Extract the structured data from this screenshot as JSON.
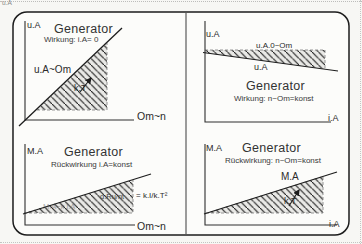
{
  "artifacts": {
    "corner_text": "u.A"
  },
  "colors": {
    "panel_border": "#1c1c1c",
    "axis": "#2e2e2e",
    "hatch_fill": "#e9e9e6",
    "hatch_line": "#1c1c1c",
    "dashed": "#8a8a8a"
  },
  "quadrants": {
    "top_left": {
      "y_axis": "u.A",
      "title": "Generator",
      "subtitle": "Wirkung: i.A= 0",
      "curve_label": "u.A~Om",
      "area_label": "k.T",
      "x_axis": "Om~n"
    },
    "top_right": {
      "y_axis": "u.A",
      "title": "Generator",
      "subtitle": "Wirkung: n~Om=konst",
      "band_top_label": "u.A.0~Om",
      "band_bottom_label": "u.A",
      "x_axis": "i.A"
    },
    "bottom_left": {
      "y_axis": "M.A",
      "title": "Generator",
      "subtitle": "Rückwirkung i.A=konst",
      "inner_label": "d.Ru/nt",
      "faint_label": "M.A~k.i.A",
      "formula": "= k.I/k.T²",
      "x_axis": "Om~n"
    },
    "bottom_right": {
      "y_axis": "M.A",
      "title": "Generator",
      "subtitle": "Rückwirkung: n~Om=konst",
      "curve_label": "M.A",
      "area_label": "k.T",
      "x_axis": "i.A"
    }
  }
}
